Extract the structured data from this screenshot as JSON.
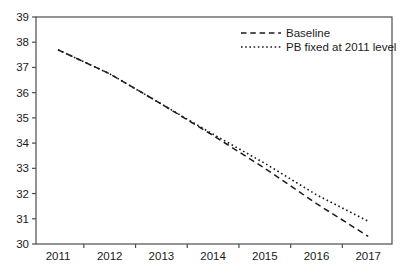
{
  "chart_data": {
    "type": "line",
    "title": "",
    "xlabel": "",
    "ylabel": "",
    "x": [
      2011,
      2012,
      2013,
      2014,
      2015,
      2016,
      2017
    ],
    "x_tick_labels": [
      "2011",
      "2012",
      "2013",
      "2014",
      "2015",
      "2016",
      "2017"
    ],
    "y_ticks": [
      30,
      31,
      32,
      33,
      34,
      35,
      36,
      37,
      38,
      39
    ],
    "ylim": [
      30,
      39
    ],
    "series": [
      {
        "name": "Baseline",
        "line_style": "dashed",
        "values": [
          37.7,
          36.75,
          35.55,
          34.3,
          33.0,
          31.6,
          30.3
        ]
      },
      {
        "name": "PB fixed at 2011 level",
        "line_style": "dotted",
        "values": [
          37.7,
          36.75,
          35.55,
          34.35,
          33.2,
          31.95,
          30.9
        ]
      }
    ],
    "grid": false,
    "legend_position": "top-right",
    "colors": {
      "line": "#1a1a1a",
      "axis": "#4d4d4d",
      "text": "#1a1a1a",
      "background": "#ffffff"
    }
  }
}
